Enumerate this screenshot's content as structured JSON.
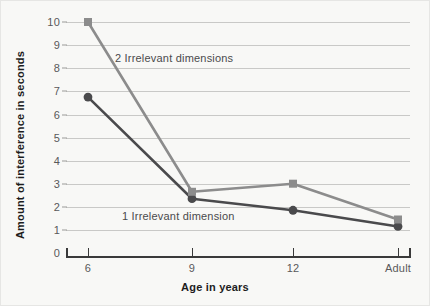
{
  "chart_data": {
    "type": "line",
    "title": "",
    "xlabel": "Age in years",
    "ylabel": "Amount of interference in seconds",
    "categories": [
      "6",
      "9",
      "12",
      "Adult"
    ],
    "yticks": [
      0,
      1,
      2,
      3,
      4,
      5,
      6,
      7,
      8,
      9,
      10
    ],
    "ylim": [
      0,
      10
    ],
    "grid": "horizontal",
    "legend_position": "inline-annotation",
    "series": [
      {
        "name": "2 Irrelevant dimensions",
        "marker": "square",
        "color": "#8c8c8c",
        "values": [
          10.0,
          2.65,
          3.0,
          1.45
        ]
      },
      {
        "name": "1 Irrelevant dimension",
        "marker": "circle",
        "color": "#4a4a4c",
        "values": [
          6.75,
          2.35,
          1.85,
          1.15
        ]
      }
    ],
    "annotations": [
      {
        "text": "2 Irrelevant dimensions",
        "series": "2 Irrelevant dimensions"
      },
      {
        "text": "1 Irrelevant dimension",
        "series": "1 Irrelevant dimension"
      }
    ]
  },
  "axis": {
    "y_tick_labels": [
      "10",
      "9",
      "8",
      "7",
      "6",
      "5",
      "4",
      "3",
      "2",
      "1",
      "0"
    ],
    "x_tick_labels": [
      "6",
      "9",
      "12",
      "Adult"
    ],
    "x_title": "Age in years",
    "y_title": "Amount of interference in seconds"
  },
  "colors": {
    "background": "#f8f8f6",
    "gridline": "#c9c9c7",
    "axis": "#3a3a3a",
    "series_2_dimensions": "#8c8c8c",
    "series_1_dimension": "#4a4a4c",
    "tick_text": "#58585a",
    "title_text": "#1d1d1d"
  }
}
